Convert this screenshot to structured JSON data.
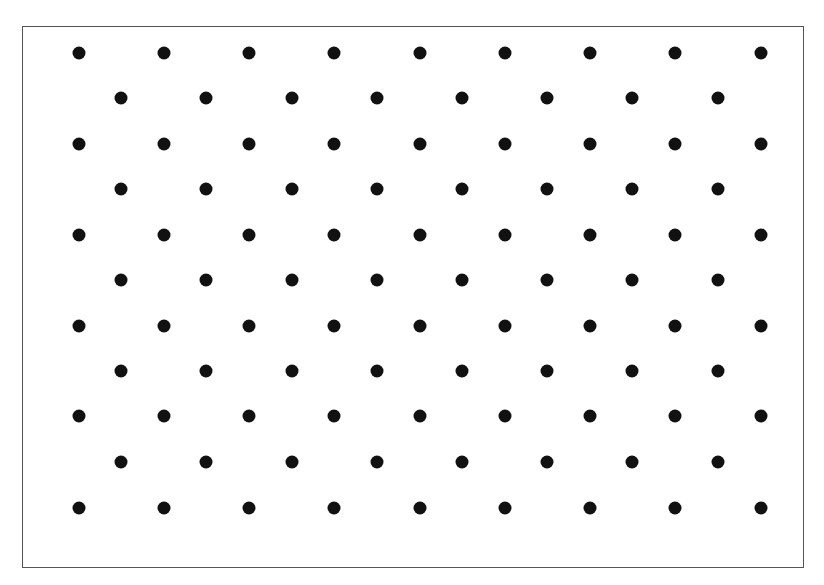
{
  "diagram": {
    "type": "dot-lattice",
    "frame": {
      "x": 22,
      "y": 26,
      "width": 782,
      "height": 542,
      "stroke": "#555555"
    },
    "dot_color": "#111111",
    "dot_radius": 6.5,
    "rows": [
      {
        "y": 53,
        "xs": [
          79,
          164,
          249,
          334,
          420,
          505,
          590,
          675,
          761
        ]
      },
      {
        "y": 98,
        "xs": [
          121,
          206,
          292,
          377,
          462,
          547,
          632,
          718
        ]
      },
      {
        "y": 144,
        "xs": [
          79,
          164,
          249,
          334,
          420,
          505,
          590,
          675,
          761
        ]
      },
      {
        "y": 189,
        "xs": [
          121,
          206,
          292,
          377,
          462,
          547,
          632,
          718
        ]
      },
      {
        "y": 235,
        "xs": [
          79,
          164,
          249,
          334,
          420,
          505,
          590,
          675,
          761
        ]
      },
      {
        "y": 280,
        "xs": [
          121,
          206,
          292,
          377,
          462,
          547,
          632,
          718
        ]
      },
      {
        "y": 326,
        "xs": [
          79,
          164,
          249,
          334,
          420,
          505,
          590,
          675,
          761
        ]
      },
      {
        "y": 371,
        "xs": [
          121,
          206,
          292,
          377,
          462,
          547,
          632,
          718
        ]
      },
      {
        "y": 416,
        "xs": [
          79,
          164,
          249,
          334,
          420,
          505,
          590,
          675,
          761
        ]
      },
      {
        "y": 462,
        "xs": [
          121,
          206,
          292,
          377,
          462,
          547,
          632,
          718
        ]
      },
      {
        "y": 508,
        "xs": [
          79,
          164,
          249,
          334,
          420,
          505,
          590,
          675,
          761
        ]
      }
    ],
    "counts": {
      "rows": 11,
      "long_row_dots": 9,
      "short_row_dots": 8,
      "total_dots": 94
    }
  }
}
